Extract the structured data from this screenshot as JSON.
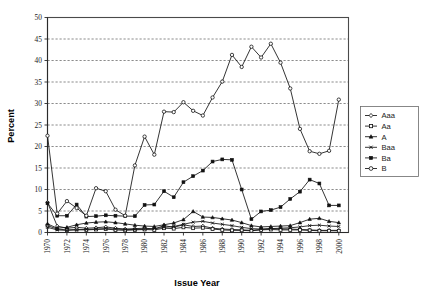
{
  "chart_data": {
    "type": "line",
    "title": "",
    "xlabel": "Issue Year",
    "ylabel": "Percent",
    "ylim": [
      0,
      50
    ],
    "ytick_step": 5,
    "yticks": [
      0,
      5,
      10,
      15,
      20,
      25,
      30,
      35,
      40,
      45,
      50
    ],
    "xlim": [
      1970,
      2001
    ],
    "x": [
      1970,
      1971,
      1972,
      1973,
      1974,
      1975,
      1976,
      1977,
      1978,
      1979,
      1980,
      1981,
      1982,
      1983,
      1984,
      1985,
      1986,
      1987,
      1988,
      1989,
      1990,
      1991,
      1992,
      1993,
      1994,
      1995,
      1996,
      1997,
      1998,
      1999,
      2000
    ],
    "xticks": [
      1970,
      1972,
      1974,
      1976,
      1978,
      1980,
      1982,
      1984,
      1986,
      1988,
      1990,
      1992,
      1994,
      1996,
      1998,
      2000
    ],
    "xtick_labels": [
      "1970",
      "1972",
      "1974",
      "1976",
      "1978",
      "1980",
      "1982",
      "1984",
      "1986",
      "1988",
      "1990",
      "1992",
      "1994",
      "1996",
      "1998",
      "2000"
    ],
    "grid": "horizontal-dashed",
    "legend_position": "right",
    "series": [
      {
        "name": "Aaa",
        "marker": "diamond",
        "values": [
          7.0,
          1.5,
          1.0,
          1.2,
          1.0,
          1.1,
          1.3,
          1.0,
          0.8,
          0.9,
          1.0,
          0.8,
          1.6,
          1.2,
          1.8,
          1.4,
          1.5,
          1.0,
          0.8,
          0.7,
          0.6,
          0.5,
          0.7,
          0.9,
          0.8,
          0.8,
          0.7,
          0.6,
          0.5,
          0.5,
          0.5
        ]
      },
      {
        "name": "Aa",
        "marker": "open-square",
        "values": [
          1.6,
          0.8,
          0.6,
          0.7,
          0.6,
          0.7,
          0.8,
          0.6,
          0.5,
          0.6,
          0.7,
          0.6,
          1.0,
          0.9,
          1.2,
          1.0,
          1.1,
          0.8,
          0.6,
          0.5,
          0.5,
          0.4,
          0.6,
          0.7,
          0.6,
          0.6,
          0.6,
          0.5,
          0.4,
          0.4,
          0.4
        ]
      },
      {
        "name": "A",
        "marker": "solid-triangle",
        "values": [
          2.0,
          1.0,
          1.2,
          1.8,
          2.2,
          2.4,
          2.5,
          2.3,
          2.0,
          1.7,
          1.5,
          1.4,
          1.8,
          2.2,
          3.0,
          4.9,
          3.6,
          3.5,
          3.2,
          2.9,
          2.3,
          1.6,
          1.3,
          1.4,
          1.5,
          1.6,
          2.3,
          3.1,
          3.3,
          2.6,
          2.3
        ]
      },
      {
        "name": "Baa",
        "marker": "cross",
        "values": [
          1.2,
          0.6,
          0.5,
          0.6,
          0.7,
          0.8,
          0.9,
          0.8,
          0.7,
          0.7,
          0.8,
          0.9,
          1.2,
          1.4,
          1.9,
          2.4,
          2.6,
          2.2,
          1.9,
          1.6,
          1.2,
          0.9,
          0.8,
          0.9,
          1.0,
          1.1,
          1.3,
          1.6,
          1.7,
          1.5,
          1.4
        ]
      },
      {
        "name": "Ba",
        "marker": "solid-square",
        "values": [
          6.8,
          3.9,
          3.9,
          6.5,
          3.7,
          3.8,
          4.0,
          3.9,
          3.8,
          3.8,
          6.4,
          6.5,
          9.6,
          8.2,
          11.7,
          13.1,
          14.4,
          16.5,
          17.0,
          16.9,
          10.0,
          3.1,
          4.9,
          5.2,
          5.9,
          7.8,
          9.5,
          12.3,
          11.4,
          6.3,
          6.3
        ]
      },
      {
        "name": "B",
        "marker": "open-circle",
        "values": [
          22.5,
          4.4,
          7.3,
          5.7,
          3.9,
          10.3,
          9.6,
          5.3,
          3.9,
          15.6,
          22.3,
          18.1,
          28.1,
          28.0,
          30.3,
          28.3,
          27.2,
          31.4,
          35.1,
          41.3,
          38.5,
          43.2,
          40.7,
          43.9,
          39.5,
          33.5,
          24.1,
          18.9,
          18.3,
          19.0,
          30.9
        ]
      }
    ]
  },
  "legend": {
    "items": [
      {
        "label": "Aaa"
      },
      {
        "label": "Aa"
      },
      {
        "label": "A"
      },
      {
        "label": "Baa"
      },
      {
        "label": "Ba"
      },
      {
        "label": "B"
      }
    ]
  },
  "axes": {
    "y_title": "Percent",
    "x_title": "Issue Year"
  },
  "colors": {
    "line": "#111111",
    "grid": "#5a5a5a",
    "frame": "#4a4a4a",
    "background": "#ffffff"
  }
}
